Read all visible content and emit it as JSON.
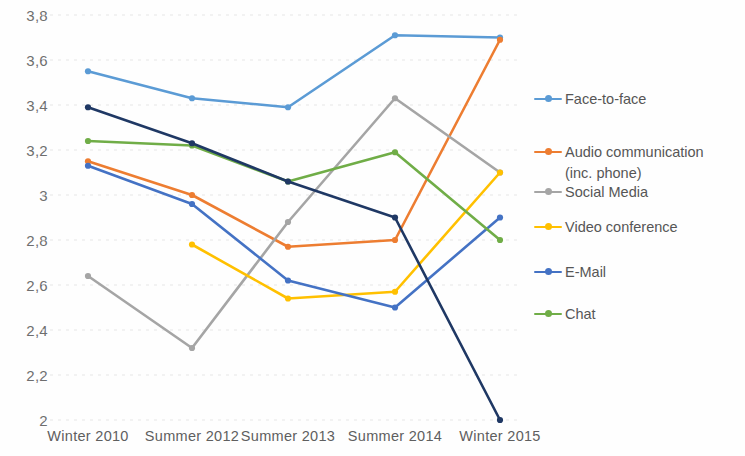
{
  "chart_data": {
    "type": "line",
    "title": "",
    "xlabel": "",
    "ylabel": "",
    "categories": [
      "Winter 2010",
      "Summer 2012",
      "Summer 2013",
      "Summer 2014",
      "Winter 2015"
    ],
    "ylim": [
      2,
      3.8
    ],
    "yticks": [
      2,
      2.2,
      2.4,
      2.6,
      2.8,
      3,
      3.2,
      3.4,
      3.6,
      3.8
    ],
    "ytick_labels": [
      "2",
      "2,2",
      "2,4",
      "2,6",
      "2,8",
      "3",
      "3,2",
      "3,4",
      "3,6",
      "3,8"
    ],
    "grid": true,
    "legend_position": "right",
    "decimal_separator": ",",
    "series": [
      {
        "name": "Face-to-face",
        "color": "#5b9bd5",
        "values": [
          3.55,
          3.43,
          3.39,
          3.71,
          3.7
        ]
      },
      {
        "name": "Audio communication (inc. phone)",
        "legend_line1": "Audio communication",
        "legend_line2": "(inc. phone)",
        "color": "#ed7d31",
        "values": [
          3.15,
          3.0,
          2.77,
          2.8,
          3.69
        ]
      },
      {
        "name": "Social Media",
        "color": "#a5a5a5",
        "values": [
          2.64,
          2.32,
          2.88,
          3.43,
          3.1
        ]
      },
      {
        "name": "Video conference",
        "color": "#ffc000",
        "values": [
          null,
          2.78,
          2.54,
          2.57,
          3.1
        ]
      },
      {
        "name": "E-Mail",
        "color": "#4472c4",
        "values": [
          3.13,
          2.96,
          2.62,
          2.5,
          2.9
        ]
      },
      {
        "name": "Chat",
        "color": "#70ad47",
        "values": [
          3.24,
          3.22,
          3.06,
          3.19,
          2.8
        ]
      },
      {
        "name": "Dark navy series",
        "color": "#1f3864",
        "values": [
          3.39,
          3.23,
          3.06,
          2.9,
          2.0
        ]
      }
    ]
  },
  "legend": {
    "items": [
      {
        "label": "Face-to-face",
        "color": "#5b9bd5"
      },
      {
        "label": "Audio communication\n(inc. phone)",
        "color": "#ed7d31"
      },
      {
        "label": "Social Media",
        "color": "#a5a5a5"
      },
      {
        "label": "Video conference",
        "color": "#ffc000"
      },
      {
        "label": "E-Mail",
        "color": "#4472c4"
      },
      {
        "label": "Chat",
        "color": "#70ad47"
      }
    ]
  }
}
